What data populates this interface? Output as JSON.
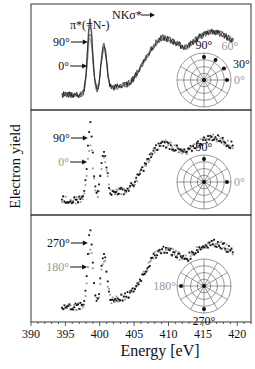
{
  "chart_data": {
    "type": "line",
    "title": "",
    "xlabel": "Energy [eV]",
    "ylabel": "Electron yield",
    "xlim": [
      390,
      422
    ],
    "x_ticks": [
      390,
      395,
      400,
      405,
      410,
      415,
      420
    ],
    "grid": false,
    "legend_position": "none",
    "panels": [
      {
        "name": "panel-1",
        "style": "lines",
        "annotations": [
          {
            "text": "π*(=N-)",
            "x": 398.8,
            "y": 0.82
          },
          {
            "text": "NKσ*",
            "x": 406.5,
            "y": 0.93
          },
          {
            "text": "90°",
            "arrow_to": 398.7,
            "color": "#111111"
          },
          {
            "text": "0°",
            "arrow_to": 398.6,
            "color": "#111111"
          }
        ],
        "series": [
          {
            "name": "90°",
            "color": "#111111",
            "peak1": 0.78,
            "peak2": 0.57
          },
          {
            "name": "60°",
            "color": "#444444",
            "peak1": 0.72,
            "peak2": 0.55
          },
          {
            "name": "30°",
            "color": "#666666",
            "peak1": 0.66,
            "peak2": 0.54
          },
          {
            "name": "0°",
            "color": "#888888",
            "peak1": 0.6,
            "peak2": 0.53
          }
        ],
        "polar": {
          "labels": [
            {
              "text": "90°",
              "color": "#111111",
              "pos": "top"
            },
            {
              "text": "60°",
              "color": "#999999",
              "pos": "top-right"
            },
            {
              "text": "30°",
              "color": "#111111",
              "pos": "right-upper"
            },
            {
              "text": "0°",
              "color": "#999999",
              "pos": "right"
            }
          ],
          "points_deg": [
            90,
            60,
            30,
            0
          ]
        }
      },
      {
        "name": "panel-2",
        "style": "dots",
        "annotations": [
          {
            "text": "90°",
            "arrow_to": 398.7,
            "color": "#111111"
          },
          {
            "text": "0°",
            "arrow_to": 398.6,
            "color": "#999999"
          }
        ],
        "series": [
          {
            "name": "90°",
            "color": "#111111",
            "peak1": 0.8,
            "peak2": 0.58
          },
          {
            "name": "0°",
            "color": "#999999",
            "peak1": 0.58,
            "peak2": 0.52
          }
        ],
        "polar": {
          "labels": [
            {
              "text": "90°",
              "color": "#111111",
              "pos": "top"
            },
            {
              "text": "0°",
              "color": "#999999",
              "pos": "right"
            }
          ],
          "points_deg": [
            90,
            0
          ]
        }
      },
      {
        "name": "panel-3",
        "style": "dots",
        "annotations": [
          {
            "text": "270°",
            "arrow_to": 398.7,
            "color": "#111111"
          },
          {
            "text": "180°",
            "arrow_to": 398.6,
            "color": "#999999"
          }
        ],
        "series": [
          {
            "name": "270°",
            "color": "#111111",
            "peak1": 0.8,
            "peak2": 0.58
          },
          {
            "name": "180°",
            "color": "#999999",
            "peak1": 0.62,
            "peak2": 0.54
          }
        ],
        "polar": {
          "labels": [
            {
              "text": "180°",
              "color": "#999999",
              "pos": "left"
            },
            {
              "text": "270°",
              "color": "#111111",
              "pos": "bottom"
            }
          ],
          "points_deg": [
            180,
            270
          ]
        }
      }
    ]
  },
  "axes": {
    "xlabel": "Energy [eV]",
    "ylabel": "Electron yield"
  }
}
